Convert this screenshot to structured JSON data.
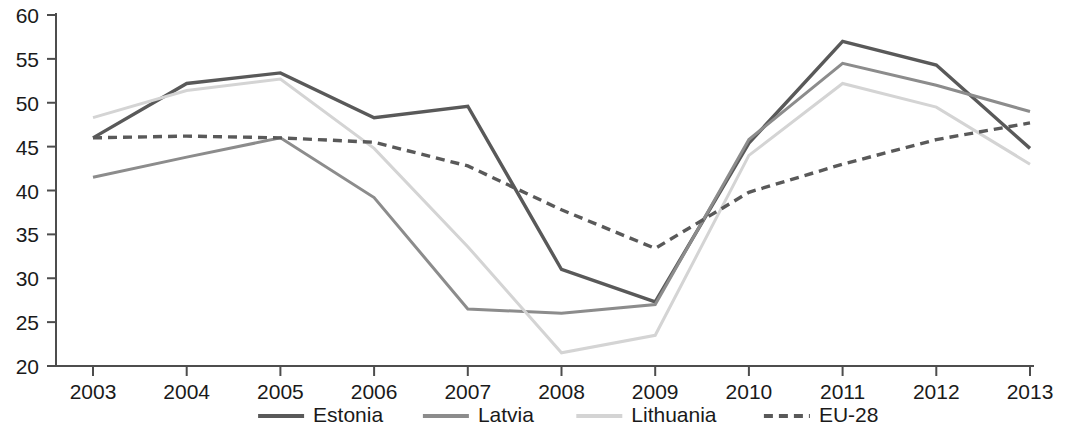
{
  "chart_data": {
    "type": "line",
    "title": "",
    "subtitle": "",
    "xlabel": "",
    "ylabel": "",
    "categories": [
      "2003",
      "2004",
      "2005",
      "2006",
      "2007",
      "2008",
      "2009",
      "2010",
      "2011",
      "2012",
      "2013"
    ],
    "x": [
      2003,
      2004,
      2005,
      2006,
      2007,
      2008,
      2009,
      2010,
      2011,
      2012,
      2013
    ],
    "ylim": [
      20,
      60
    ],
    "yticks": [
      20,
      25,
      30,
      35,
      40,
      45,
      50,
      55,
      60
    ],
    "ytick_labels": [
      "20",
      "25",
      "30",
      "35",
      "40",
      "45",
      "50",
      "55",
      "60"
    ],
    "grid": false,
    "legend_position": "bottom",
    "series": [
      {
        "name": "Estonia",
        "color": "#595959",
        "width": 3.4,
        "dash": "",
        "values": [
          46.0,
          52.2,
          53.4,
          48.3,
          49.6,
          31.0,
          27.3,
          45.4,
          57.0,
          54.3,
          44.8
        ]
      },
      {
        "name": "Latvia",
        "color": "#8c8c8c",
        "width": 3.0,
        "dash": "",
        "values": [
          41.5,
          43.8,
          46.0,
          39.2,
          26.5,
          26.0,
          27.0,
          45.8,
          54.5,
          52.0,
          49.0
        ]
      },
      {
        "name": "Lithuania",
        "color": "#d4d4d4",
        "width": 3.0,
        "dash": "",
        "values": [
          48.3,
          51.4,
          52.7,
          44.8,
          33.6,
          21.5,
          23.5,
          44.0,
          52.2,
          49.5,
          43.0
        ]
      },
      {
        "name": "EU-28",
        "color": "#595959",
        "width": 3.4,
        "dash": "9 6",
        "values": [
          46.0,
          46.2,
          46.0,
          45.5,
          42.8,
          37.8,
          33.4,
          39.8,
          43.0,
          45.8,
          47.7
        ]
      }
    ]
  },
  "legend": {
    "items": [
      {
        "label": "Estonia"
      },
      {
        "label": "Latvia"
      },
      {
        "label": "Lithuania"
      },
      {
        "label": "EU-28"
      }
    ]
  }
}
